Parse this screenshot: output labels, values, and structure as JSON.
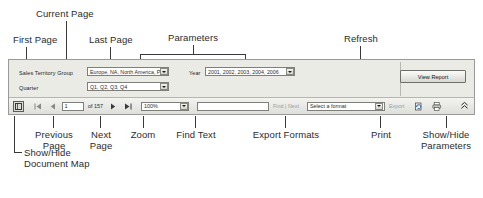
{
  "annotations": {
    "first_page": "First Page",
    "current_page": "Current Page",
    "last_page": "Last Page",
    "parameters": "Parameters",
    "refresh": "Refresh",
    "previous_page": "Previous\nPage",
    "next_page": "Next\nPage",
    "zoom": "Zoom",
    "find_text": "Find Text",
    "export_formats": "Export Formats",
    "print": "Print",
    "show_hide_parameters": "Show/Hide\nParameters",
    "show_hide_document_map": "Show/Hide\nDocument Map"
  },
  "viewer": {
    "parameters": [
      {
        "label": "Sales Territory Group",
        "value": "Europe, NA, North America, Pa",
        "icon": "chevron-down-icon"
      },
      {
        "label": "Quarter",
        "value": "Q1, Q2, Q3, Q4",
        "icon": "chevron-down-icon"
      },
      {
        "label": "Year",
        "value": "2001, 2002, 2003, 2004, 2006",
        "icon": "chevron-down-icon"
      }
    ],
    "view_report_label": "View Report"
  },
  "toolbar": {
    "document_map_icon": "document-map-icon",
    "first_page_icon": "first-page-icon",
    "first_page_glyph": "|◀",
    "previous_page_icon": "previous-page-icon",
    "previous_page_glyph": "◀",
    "page_number": "1",
    "page_count_label": "of 157",
    "next_page_icon": "next-page-icon",
    "next_page_glyph": "▶",
    "last_page_icon": "last-page-icon",
    "last_page_glyph": "▶|",
    "zoom_value": "100%",
    "zoom_icon": "chevron-down-icon",
    "find_value": "",
    "find_placeholder": "",
    "find_label": "Find | Next",
    "format_value": "Select a format",
    "format_icon": "chevron-down-icon",
    "export_label": "Export",
    "refresh_icon": "refresh-icon",
    "print_icon": "print-icon",
    "show_hide_parameters_icon": "double-chevron-up-icon",
    "show_hide_parameters_glyph": "«"
  },
  "colors": {
    "panel_bg": "#e9e9e4",
    "toolbar_bg": "#eaeae6",
    "border": "#9a9a9a",
    "text": "#2b2b2b",
    "leader_line": "#3a3a3a"
  }
}
